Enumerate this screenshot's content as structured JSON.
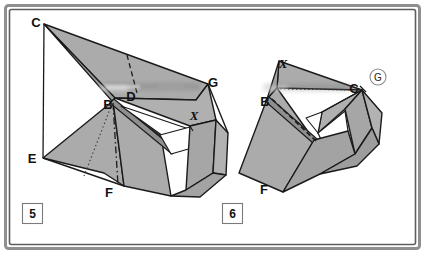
{
  "figure": {
    "background_color": "#ffffff",
    "frame": {
      "outer_color": "#8c8c8c",
      "inner_color": "#595959",
      "note": "double-line rounded rectangle border"
    },
    "paper_fill": "#ababab",
    "paper_fill_light": "#b7b7b7",
    "paper_fill_dark": "#9d9d9d",
    "paper_white": "#ffffff",
    "stroke_color": "#1a1a1a"
  },
  "steps": [
    {
      "id": "step-5",
      "number": "5",
      "labels": [
        {
          "id": "c",
          "text": "C",
          "x": 36,
          "y": 27,
          "style": "upright"
        },
        {
          "id": "b",
          "text": "B",
          "x": 108,
          "y": 109,
          "style": "upright"
        },
        {
          "id": "d",
          "text": "D",
          "x": 131,
          "y": 101,
          "style": "upright"
        },
        {
          "id": "e",
          "text": "E",
          "x": 32,
          "y": 163,
          "style": "upright"
        },
        {
          "id": "f",
          "text": "F",
          "x": 109,
          "y": 197,
          "style": "upright"
        },
        {
          "id": "g",
          "text": "G",
          "x": 213,
          "y": 87,
          "style": "upright"
        },
        {
          "id": "x",
          "text": "X",
          "x": 194,
          "y": 120,
          "style": "italic"
        }
      ]
    },
    {
      "id": "step-6",
      "number": "6",
      "labels": [
        {
          "id": "x",
          "text": "X",
          "x": 283,
          "y": 68,
          "style": "italic"
        },
        {
          "id": "b",
          "text": "B",
          "x": 265,
          "y": 106,
          "style": "upright"
        },
        {
          "id": "c",
          "text": "C",
          "x": 354,
          "y": 93,
          "style": "upright"
        },
        {
          "id": "f",
          "text": "F",
          "x": 264,
          "y": 194,
          "style": "upright"
        },
        {
          "id": "g_circled",
          "text": "G",
          "x": 378,
          "y": 81,
          "style": "circled"
        }
      ]
    }
  ],
  "annotations": {
    "circled_marker_radius": 8,
    "dashed_fold_note": "dash-dot fold line",
    "dotted_fold_note": "dotted reference line"
  }
}
